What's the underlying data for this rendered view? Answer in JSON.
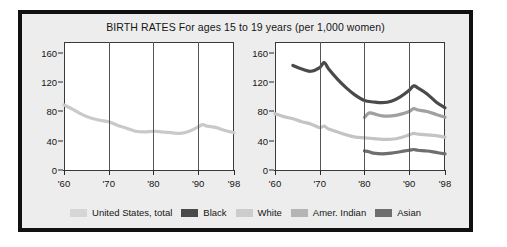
{
  "chart_data": {
    "type": "line",
    "title": "BIRTH RATES For ages 15 to 19 years (per 1,000 women)",
    "xlabel": "",
    "ylabel": "",
    "ylim": [
      0,
      175
    ],
    "xlim": [
      1960,
      1998
    ],
    "grid": true,
    "legend_position": "bottom",
    "yticks": [
      "0",
      "40",
      "80",
      "120",
      "160"
    ],
    "ytick_values": [
      0,
      40,
      80,
      120,
      160
    ],
    "xticks": [
      "'60",
      "'70",
      "'80",
      "'90",
      "'98"
    ],
    "xtick_values": [
      1960,
      1970,
      1980,
      1990,
      1998
    ],
    "panels": [
      {
        "name": "left-panel",
        "series": [
          {
            "name": "United States, total",
            "color": "#c9c9c9",
            "x": [
              1960,
              1962,
              1964,
              1966,
              1968,
              1970,
              1972,
              1974,
              1976,
              1978,
              1980,
              1982,
              1984,
              1986,
              1988,
              1990,
              1991,
              1992,
              1994,
              1996,
              1998
            ],
            "values": [
              89,
              83,
              76,
              71,
              68,
              66,
              61,
              57,
              53,
              52,
              53,
              52,
              51,
              50,
              53,
              59,
              62,
              60,
              58,
              54,
              51
            ]
          }
        ]
      },
      {
        "name": "right-panel",
        "series": [
          {
            "name": "Black",
            "color": "#4a4a4a",
            "x": [
              1964,
              1966,
              1968,
              1970,
              1971,
              1972,
              1974,
              1976,
              1978,
              1980,
              1982,
              1984,
              1986,
              1988,
              1990,
              1991,
              1992,
              1994,
              1996,
              1998
            ],
            "values": [
              143,
              138,
              135,
              140,
              147,
              138,
              124,
              112,
              102,
              95,
              93,
              92,
              94,
              100,
              109,
              115,
              112,
              104,
              93,
              85
            ]
          },
          {
            "name": "White",
            "color": "#a0a0a0",
            "x": [
              1980,
              1981,
              1982,
              1984,
              1986,
              1988,
              1990,
              1991,
              1992,
              1994,
              1996,
              1998
            ],
            "values": [
              72,
              78,
              77,
              74,
              74,
              76,
              80,
              84,
              82,
              80,
              76,
              72
            ]
          },
          {
            "name": "Amer. Indian",
            "color": "#c4c4c4",
            "x": [
              1960,
              1962,
              1964,
              1966,
              1968,
              1970,
              1971,
              1972,
              1974,
              1976,
              1978,
              1980,
              1982,
              1984,
              1986,
              1988,
              1990,
              1991,
              1992,
              1994,
              1996,
              1998
            ],
            "values": [
              77,
              73,
              70,
              66,
              63,
              58,
              60,
              56,
              52,
              48,
              45,
              44,
              43,
              42,
              42,
              44,
              48,
              50,
              49,
              48,
              47,
              45
            ]
          },
          {
            "name": "Asian",
            "color": "#6e6e6e",
            "x": [
              1980,
              1981,
              1982,
              1984,
              1986,
              1988,
              1990,
              1991,
              1992,
              1994,
              1996,
              1998
            ],
            "values": [
              26,
              25,
              23,
              22,
              23,
              25,
              27,
              28,
              27,
              26,
              24,
              22
            ]
          }
        ]
      }
    ]
  },
  "legend": {
    "items": [
      {
        "label": "United States, total",
        "color": "#d6d6d6"
      },
      {
        "label": "Black",
        "color": "#4a4a4a"
      },
      {
        "label": "White",
        "color": "#cccccc"
      },
      {
        "label": "Amer. Indian",
        "color": "#b4b4b4"
      },
      {
        "label": "Asian",
        "color": "#6e6e6e"
      }
    ]
  }
}
